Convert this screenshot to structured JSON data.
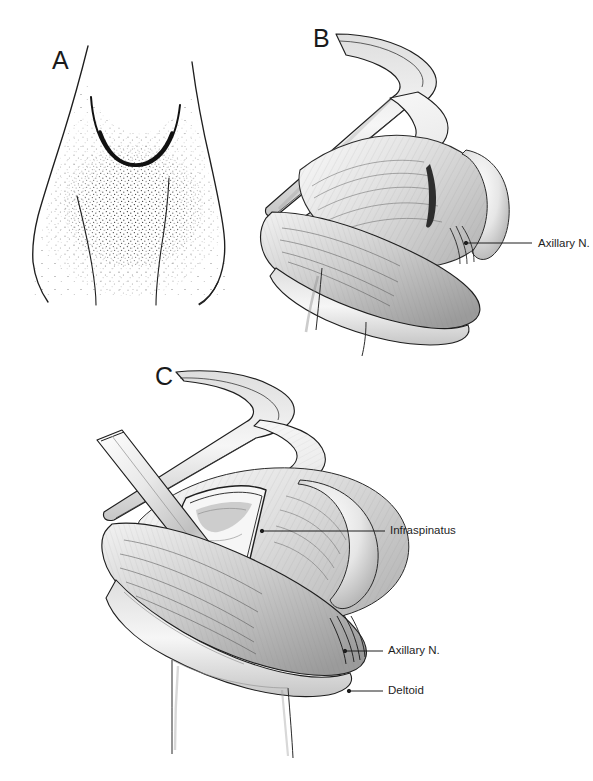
{
  "figure": {
    "background_color": "#ffffff",
    "ink_color": "#1e1e1e",
    "shade_color": "#8d8d8d",
    "width": 593,
    "height": 781,
    "corner_watermark": "",
    "medium": "pen-and-ink / pencil medical illustration"
  },
  "panels": [
    {
      "id": "A",
      "letter": "A",
      "letter_x": 52,
      "letter_y": 48,
      "caption": "Posterior shoulder surface anatomy with planned curved incision"
    },
    {
      "id": "B",
      "letter": "B",
      "letter_x": 313,
      "letter_y": 26,
      "caption": "Superficial surgical exposure with retracted skin and fascial flaps"
    },
    {
      "id": "C",
      "letter": "C",
      "letter_x": 155,
      "letter_y": 364,
      "caption": "Deep dissection with retractor exposing infraspinatus"
    }
  ],
  "annotations": [
    {
      "id": "b-axillary-nerve",
      "panel": "B",
      "label": "Axillary N.",
      "text_x": 538,
      "text_y": 240,
      "leader": {
        "x1": 466,
        "y1": 243,
        "x2": 532,
        "y2": 243
      },
      "pointer": {
        "x": 466,
        "y": 243
      }
    },
    {
      "id": "c-infraspinatus",
      "panel": "C",
      "label": "Infraspinatus",
      "text_x": 390,
      "text_y": 527,
      "leader": {
        "x1": 262,
        "y1": 531,
        "x2": 385,
        "y2": 531
      },
      "pointer": {
        "x": 262,
        "y": 531
      }
    },
    {
      "id": "c-axillary-nerve",
      "panel": "C",
      "label": "Axillary N.",
      "text_x": 388,
      "text_y": 647,
      "leader": {
        "x1": 345,
        "y1": 651,
        "x2": 383,
        "y2": 651
      },
      "pointer": {
        "x": 345,
        "y": 651
      }
    },
    {
      "id": "c-deltoid",
      "panel": "C",
      "label": "Deltoid",
      "text_x": 388,
      "text_y": 687,
      "leader": {
        "x1": 349,
        "y1": 691,
        "x2": 383,
        "y2": 691
      },
      "pointer": {
        "x": 349,
        "y": 691
      }
    }
  ]
}
